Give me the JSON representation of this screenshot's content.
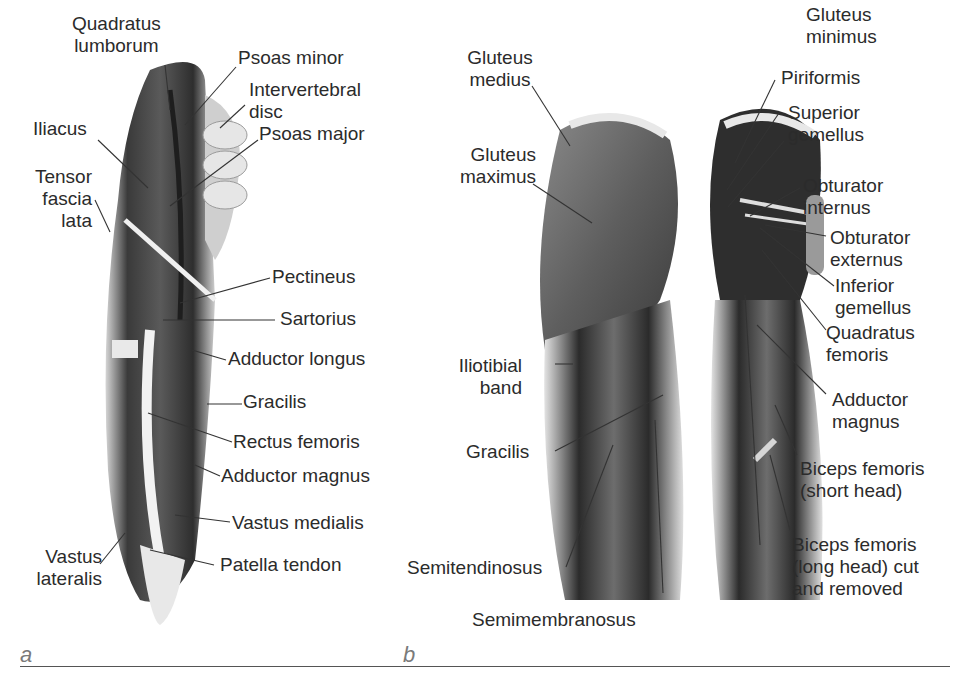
{
  "figure": {
    "panels": [
      {
        "id": "a",
        "letter": "a",
        "view": "anterior thigh and hip",
        "labels": {
          "quadratus_lumborum_1": "Quadratus",
          "quadratus_lumborum_2": "lumborum",
          "psoas_minor": "Psoas minor",
          "intervertebral_disc_1": "Intervertebral",
          "intervertebral_disc_2": "disc",
          "iliacus": "Iliacus",
          "psoas_major": "Psoas major",
          "tensor_fascia_lata_1": "Tensor",
          "tensor_fascia_lata_2": "fascia",
          "tensor_fascia_lata_3": "lata",
          "pectineus": "Pectineus",
          "sartorius": "Sartorius",
          "adductor_longus": "Adductor longus",
          "gracilis": "Gracilis",
          "rectus_femoris": "Rectus femoris",
          "adductor_magnus": "Adductor magnus",
          "vastus_medialis": "Vastus medialis",
          "patella_tendon": "Patella tendon",
          "vastus_lateralis_1": "Vastus",
          "vastus_lateralis_2": "lateralis"
        }
      },
      {
        "id": "b",
        "letter": "b",
        "view": "posterior hip and thigh",
        "labels": {
          "gluteus_medius_1": "Gluteus",
          "gluteus_medius_2": "medius",
          "gluteus_maximus_1": "Gluteus",
          "gluteus_maximus_2": "maximus",
          "iliotibial_band_1": "Iliotibial",
          "iliotibial_band_2": "band",
          "gracilis": "Gracilis",
          "semitendinosus": "Semitendinosus",
          "semimembranosus": "Semimembranosus",
          "gluteus_minimus_1": "Gluteus",
          "gluteus_minimus_2": "minimus",
          "piriformis": "Piriformis",
          "superior_gemellus_1": "Superior",
          "superior_gemellus_2": "gemellus",
          "obturator_internus_1": "Obturator",
          "obturator_internus_2": "internus",
          "obturator_externus_1": "Obturator",
          "obturator_externus_2": "externus",
          "inferior_gemellus_1": "Inferior",
          "inferior_gemellus_2": "gemellus",
          "quadratus_femoris_1": "Quadratus",
          "quadratus_femoris_2": "femoris",
          "adductor_magnus_1": "Adductor",
          "adductor_magnus_2": "magnus",
          "biceps_short_1": "Biceps femoris",
          "biceps_short_2": "(short head)",
          "biceps_long_1": "Biceps femoris",
          "biceps_long_2": "(long head) cut",
          "biceps_long_3": "and removed"
        }
      }
    ]
  },
  "colors": {
    "text": "#2b2b2b",
    "leader": "#333333",
    "muscle_dark": "#2e2e2e",
    "muscle_mid": "#6a6a6a",
    "muscle_light": "#c9c9c9",
    "letter": "#7a7a7a"
  }
}
